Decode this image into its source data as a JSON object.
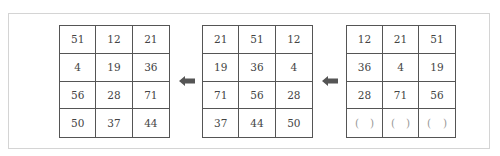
{
  "grids": [
    {
      "id": "result",
      "cells": [
        "51",
        "12",
        "21",
        "4",
        "19",
        "36",
        "56",
        "28",
        "71",
        "50",
        "37",
        "44"
      ]
    },
    {
      "id": "middle",
      "cells": [
        "21",
        "51",
        "12",
        "19",
        "36",
        "4",
        "71",
        "56",
        "28",
        "37",
        "44",
        "50"
      ]
    },
    {
      "id": "start",
      "cells": [
        "12",
        "21",
        "51",
        "36",
        "4",
        "19",
        "28",
        "71",
        "56"
      ],
      "blank_row": [
        [
          "(",
          ")"
        ],
        [
          "(",
          ")"
        ],
        [
          "(",
          ")"
        ]
      ]
    }
  ],
  "arrows": [
    {
      "direction": "left",
      "color": "#555555"
    },
    {
      "direction": "left",
      "color": "#555555"
    }
  ]
}
